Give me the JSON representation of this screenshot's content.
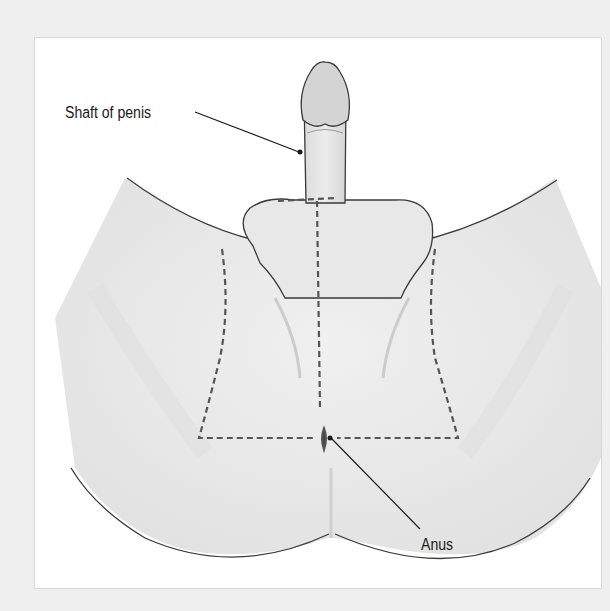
{
  "diagram": {
    "type": "anatomical-illustration",
    "labels": [
      {
        "id": "shaft",
        "text": "Shaft of penis"
      },
      {
        "id": "anus",
        "text": "Anus"
      }
    ],
    "colors": {
      "page_background": "#efefef",
      "panel_background": "#ffffff",
      "skin_light": "#f4f4f4",
      "skin_shade": "#d9d9d9",
      "glans": "#d4d4d4",
      "outline": "#3a3a3a",
      "dashed_line": "#555555",
      "label_text": "#1a1a1a"
    }
  }
}
